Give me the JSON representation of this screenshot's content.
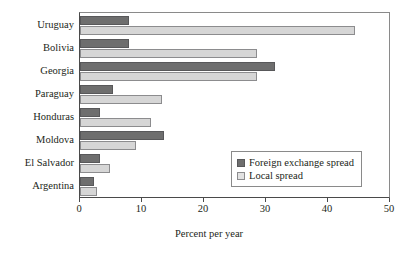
{
  "chart_data": {
    "type": "bar",
    "orientation": "horizontal",
    "title": "",
    "xlabel": "Percent per year",
    "ylabel": "",
    "xlim": [
      0,
      50
    ],
    "xticks": [
      0,
      10,
      20,
      30,
      40,
      50
    ],
    "grid": false,
    "legend_position": "inside-right",
    "categories": [
      "Uruguay",
      "Bolivia",
      "Georgia",
      "Paraguay",
      "Honduras",
      "Moldova",
      "El Salvador",
      "Argentina"
    ],
    "series": [
      {
        "name": "Foreign exchange spread",
        "color": "#6e6e6e",
        "values": [
          7.9,
          7.9,
          31.5,
          5.3,
          3.2,
          13.6,
          3.2,
          2.3
        ]
      },
      {
        "name": "Local spread",
        "color": "#d6d6d6",
        "values": [
          44.4,
          28.6,
          28.6,
          13.2,
          11.4,
          9.0,
          4.8,
          2.8
        ]
      }
    ]
  },
  "legend": {
    "items": [
      {
        "label": "Foreign exchange spread",
        "swatch": "fx"
      },
      {
        "label": "Local spread",
        "swatch": "local"
      }
    ]
  },
  "axis": {
    "x_title": "Percent per year",
    "tick_labels": [
      "0",
      "10",
      "20",
      "30",
      "40",
      "50"
    ]
  }
}
